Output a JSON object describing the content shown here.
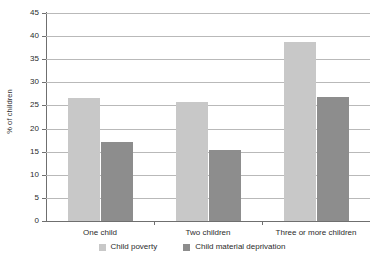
{
  "chart_data": {
    "type": "bar",
    "title": "",
    "subtitle": "",
    "xlabel": "",
    "ylabel": "% of children",
    "ylim": [
      0,
      45
    ],
    "yticks": [
      0,
      5,
      10,
      15,
      20,
      25,
      30,
      35,
      40,
      45
    ],
    "ytick_labels": [
      "0",
      "5",
      "10",
      "15",
      "20",
      "25",
      "30",
      "35",
      "40",
      "45"
    ],
    "grid": true,
    "legend_position": "bottom",
    "categories": [
      "One child",
      "Two children",
      "Three or more children"
    ],
    "series": [
      {
        "name": "Child poverty",
        "color": "#c8c8c8",
        "values": [
          26.7,
          25.7,
          38.8
        ]
      },
      {
        "name": "Child material deprivation",
        "color": "#8d8d8d",
        "values": [
          17.0,
          15.4,
          26.8
        ]
      }
    ],
    "annotations": []
  },
  "style": {
    "background": "#ffffff",
    "axis_color": "#6f6f6f",
    "grid_color": "#b9b9b9",
    "text_color": "#2b2b2b"
  }
}
